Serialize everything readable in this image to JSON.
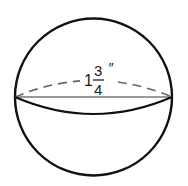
{
  "diagram": {
    "shape": "sphere",
    "label": {
      "whole": "1",
      "numerator": "3",
      "denominator": "4",
      "unit": "″"
    },
    "measurement": "diameter",
    "colors": {
      "outline": "#111111",
      "diameter_line": "#777777",
      "dashed_arc": "#666666",
      "background": "#ffffff"
    }
  }
}
